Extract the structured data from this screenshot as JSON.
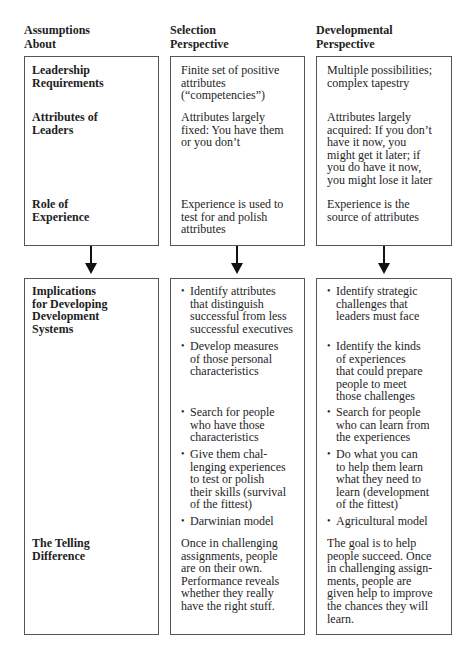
{
  "headers": {
    "col1": "Assumptions About",
    "col1_l1": "Assumptions",
    "col1_l2": "About",
    "col2_l1": "Selection",
    "col2_l2": "Perspective",
    "col3_l1": "Developmental",
    "col3_l2": "Perspective"
  },
  "top": {
    "rows": [
      {
        "label": [
          "Leadership",
          "Requirements"
        ],
        "selection": [
          "Finite set of positive",
          "attributes",
          "(“competencies”)"
        ],
        "developmental": [
          "Multiple possibilities;",
          "complex tapestry"
        ]
      },
      {
        "label": [
          "Attributes of",
          "Leaders"
        ],
        "selection": [
          "Attributes largely",
          "fixed: You have them",
          "or you don’t"
        ],
        "developmental": [
          "Attributes largely",
          "acquired: If you don’t",
          "have it now, you",
          "might get it later; if",
          "you do have it now,",
          "you might lose it later"
        ]
      },
      {
        "label": [
          "Role of",
          "Experience"
        ],
        "selection": [
          "Experience is used to",
          "test for and polish",
          "attributes"
        ],
        "developmental": [
          "Experience is the",
          "source of attributes"
        ]
      }
    ]
  },
  "bottom": {
    "implications": {
      "label": [
        "Implications",
        "for Developing",
        "Development",
        "Systems"
      ],
      "selection": [
        [
          "Identify attributes",
          "that distinguish",
          "successful from less",
          "successful executives"
        ],
        [
          "Develop measures",
          "of those personal",
          "characteristics"
        ],
        [
          "Search for people",
          "who have those",
          "characteristics"
        ],
        [
          "Give them chal-",
          "lenging experiences",
          "to test or polish",
          "their skills (survival",
          "of the fittest)"
        ],
        [
          "Darwinian model"
        ]
      ],
      "developmental": [
        [
          "Identify strategic",
          "challenges that",
          "leaders must face"
        ],
        [
          "Identify the kinds",
          "of experiences",
          "that could prepare",
          "people to meet",
          "those challenges"
        ],
        [
          "Search for people",
          "who can learn from",
          "the experiences"
        ],
        [
          "Do what you can",
          "to help them learn",
          "what they need to",
          "learn (development",
          "of the fittest)"
        ],
        [
          "Agricultural model"
        ]
      ]
    },
    "telling": {
      "label": [
        "The Telling",
        "Difference"
      ],
      "selection": [
        "Once in challenging",
        "assignments, people",
        "are on their own.",
        "Performance reveals",
        "whether they really",
        "have the right stuff."
      ],
      "developmental": [
        "The goal is to help",
        "people succeed. Once",
        "in challenging assign-",
        "ments, people are",
        "given help to improve",
        "the chances they will",
        "learn."
      ]
    }
  }
}
